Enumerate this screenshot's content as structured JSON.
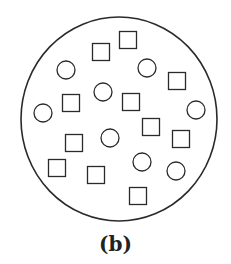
{
  "caption": "(b)",
  "colors": {
    "stroke": "#2a2a2a",
    "background": "#ffffff"
  },
  "container": {
    "shape": "circle",
    "cx": 119,
    "cy": 119,
    "rx": 98,
    "ry": 102
  },
  "squares": [
    {
      "cx": 101,
      "cy": 52
    },
    {
      "cx": 128,
      "cy": 40
    },
    {
      "cx": 177,
      "cy": 81
    },
    {
      "cx": 71,
      "cy": 103
    },
    {
      "cx": 131,
      "cy": 102
    },
    {
      "cx": 151,
      "cy": 127
    },
    {
      "cx": 181,
      "cy": 139
    },
    {
      "cx": 74,
      "cy": 143
    },
    {
      "cx": 57,
      "cy": 168
    },
    {
      "cx": 96,
      "cy": 175
    },
    {
      "cx": 138,
      "cy": 196
    }
  ],
  "circles": [
    {
      "cx": 66,
      "cy": 70
    },
    {
      "cx": 147,
      "cy": 68
    },
    {
      "cx": 103,
      "cy": 92
    },
    {
      "cx": 43,
      "cy": 113
    },
    {
      "cx": 196,
      "cy": 110
    },
    {
      "cx": 110,
      "cy": 138
    },
    {
      "cx": 142,
      "cy": 162
    },
    {
      "cx": 176,
      "cy": 171
    }
  ],
  "shape_size": {
    "square_side": 17,
    "circle_radius": 9
  }
}
